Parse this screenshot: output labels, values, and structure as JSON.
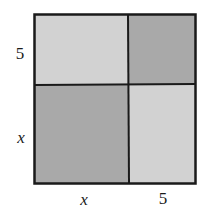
{
  "diagram": {
    "type": "area-model-square",
    "colors": {
      "light": "#d2d2d2",
      "dark": "#a9a9a9",
      "border": "#1a1a1a",
      "background": "#ffffff"
    },
    "regions": [
      {
        "id": "top-left",
        "width_label": "x",
        "height_label": "5",
        "shade": "light"
      },
      {
        "id": "top-right",
        "width_label": "5",
        "height_label": "5",
        "shade": "dark"
      },
      {
        "id": "bottom-left",
        "width_label": "x",
        "height_label": "x",
        "shade": "dark"
      },
      {
        "id": "bottom-right",
        "width_label": "5",
        "height_label": "x",
        "shade": "light"
      }
    ],
    "labels": {
      "left_top": "5",
      "left_bottom": "x",
      "bottom_left": "x",
      "bottom_right": "5"
    }
  }
}
